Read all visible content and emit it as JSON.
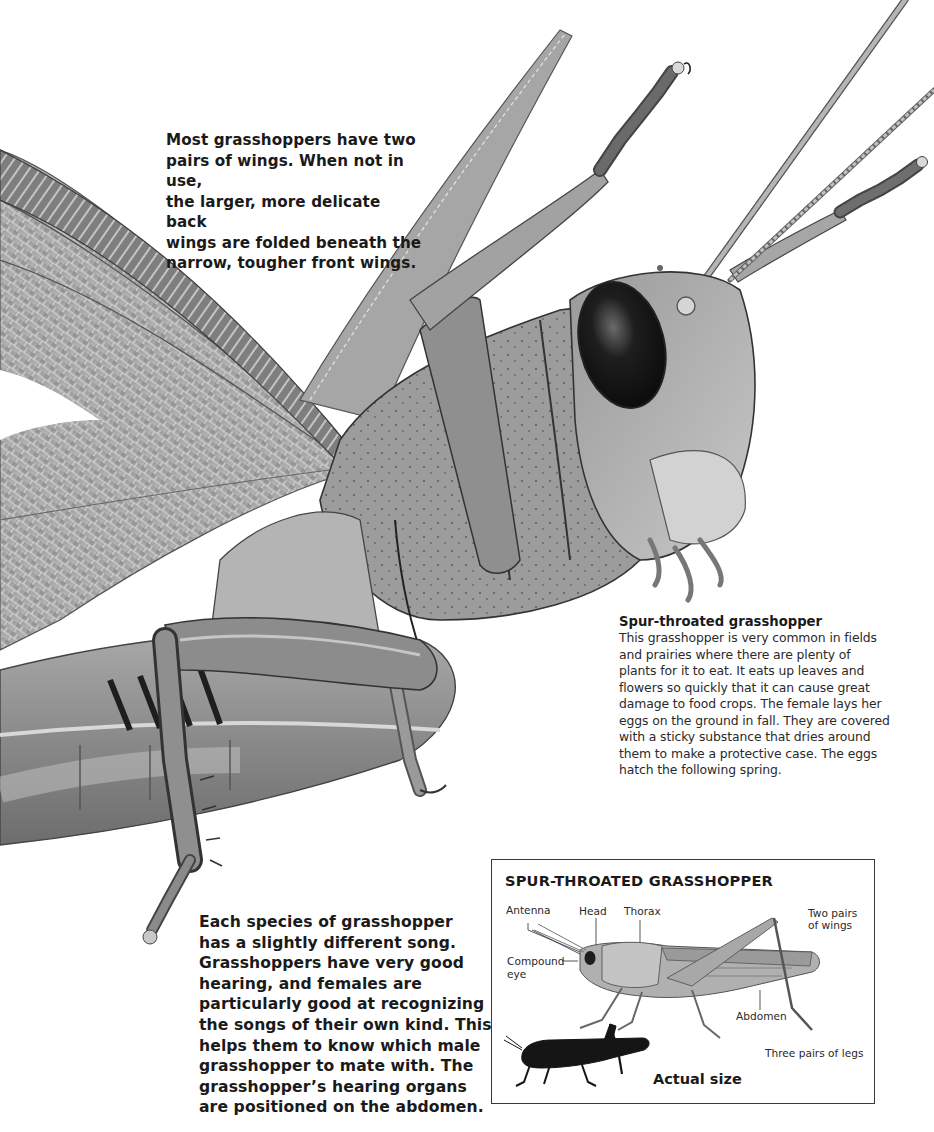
{
  "page": {
    "background": "#ffffff",
    "ink_color": "#1a1a1a",
    "illustration": {
      "subject": "spur-throated grasshopper close-up",
      "style": "grayscale pencil illustration",
      "parts_visible": [
        "back-wing",
        "front-wing",
        "compound-eye",
        "antennae",
        "head",
        "thorax",
        "abdomen",
        "raised-front-legs",
        "middle-leg",
        "hind-leg"
      ]
    }
  },
  "captions": {
    "wings": {
      "lines": [
        "Most grasshoppers have two",
        "pairs of wings. When not in use,",
        "the larger, more delicate back",
        "wings are folded beneath the",
        "narrow, tougher front wings."
      ]
    },
    "song": {
      "lines": [
        "Each species of grasshopper",
        "has a slightly different song.",
        "Grasshoppers have very good",
        "hearing, and females are",
        "particularly good at recognizing",
        "the songs of their own kind. This",
        "helps them to know which male",
        "grasshopper to mate with. The",
        "grasshopper’s hearing organs",
        "are positioned on the abdomen."
      ]
    }
  },
  "species": {
    "title": "Spur-throated grasshopper",
    "body_lines": [
      "This grasshopper is very common in fields",
      "and prairies where there are plenty of",
      "plants for it to eat. It eats up leaves and",
      "flowers so quickly that it can cause great",
      "damage to food crops. The female lays her",
      "eggs on the ground in fall. They are covered",
      "with a sticky substance that dries around",
      "them to make a protective case. The eggs",
      "hatch the following spring."
    ]
  },
  "inset": {
    "title": "SPUR-THROATED GRASSHOPPER",
    "labels": {
      "antenna": "Antenna",
      "head": "Head",
      "thorax": "Thorax",
      "wings_line1": "Two pairs",
      "wings_line2": "of wings",
      "eye_line1": "Compound",
      "eye_line2": "eye",
      "abdomen": "Abdomen",
      "legs": "Three pairs of legs"
    },
    "actual_size_label": "Actual size",
    "border_color": "#3a3a3a",
    "silhouette_color": "#151515"
  }
}
